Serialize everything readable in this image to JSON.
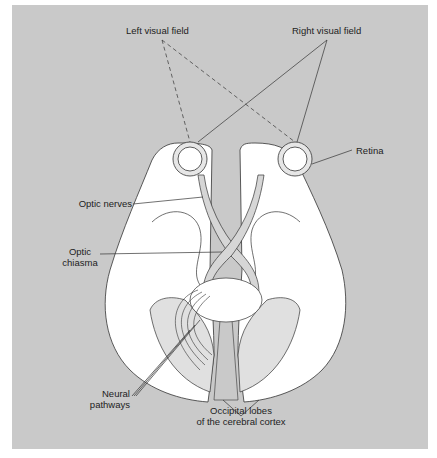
{
  "diagram": {
    "background_color": "#c9c9c9",
    "brain_color": "#ffffff",
    "pathway_color": "#d6d6d6",
    "line_color": "#333333",
    "labels": {
      "left_visual_field": "Left visual field",
      "right_visual_field": "Right visual field",
      "retina": "Retina",
      "optic_nerves": "Optic nerves",
      "optic_chiasma_line1": "Optic",
      "optic_chiasma_line2": "chiasma",
      "neural_pathways_line1": "Neural",
      "neural_pathways_line2": "pathways",
      "occipital_line1": "Occipital lobes",
      "occipital_line2": "of the cerebral cortex"
    }
  }
}
